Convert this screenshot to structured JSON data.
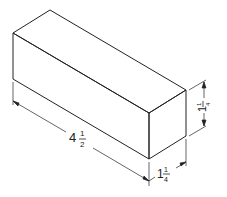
{
  "figure": {
    "type": "isometric-block-drawing",
    "line_color": "#222222",
    "background": "#ffffff"
  },
  "dimensions": {
    "length": {
      "whole": "4",
      "numerator": "1",
      "denominator": "2",
      "text": "4 1/2"
    },
    "width": {
      "whole": "1",
      "numerator": "1",
      "denominator": "4",
      "text": "1 1/4"
    },
    "height": {
      "whole": "1",
      "numerator": "1",
      "denominator": "4",
      "text": "1 1/4"
    }
  }
}
